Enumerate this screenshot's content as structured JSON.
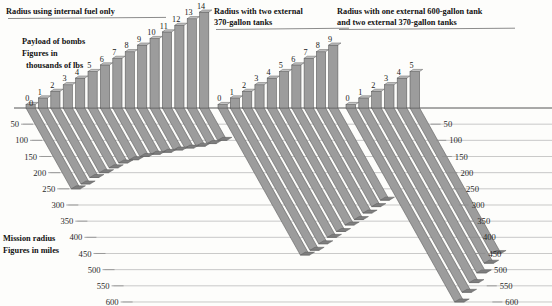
{
  "figure": {
    "kind": "combat-radius-infographic",
    "legend_note_line1": "Payload of bombs",
    "legend_note_line2": "Figures in",
    "legend_note_line3": "thousands of lbs",
    "axis_note_line1": "Mission radius",
    "axis_note_line2": "Figures in miles",
    "panel_titles": [
      {
        "line1": "Radius using internal fuel only",
        "line2": ""
      },
      {
        "line1": "Radius with two external",
        "line2": "370-gallon tanks"
      },
      {
        "line1": "Radius with one external 600-gallon tank",
        "line2": "and two external 370-gallon tanks"
      }
    ],
    "colors": {
      "bar_fill": "#9c9c9c",
      "bar_edge": "#5e5e5e",
      "bar_top": "#c3c3c3",
      "gridline": "#b7b7b7",
      "baseline": "#555555",
      "text": "#1a1a1a",
      "background": "#fdfdfb"
    }
  },
  "axis": {
    "label": "Mission radius",
    "unit": "miles",
    "ticks": [
      0,
      50,
      100,
      150,
      200,
      250,
      300,
      350,
      400,
      450,
      500,
      550,
      600
    ],
    "tick_labels": [
      "0",
      "50",
      "100",
      "150",
      "200",
      "250",
      "300",
      "350",
      "400",
      "450",
      "500",
      "550",
      "600"
    ],
    "min": 0,
    "max": 600
  },
  "chart_data": [
    {
      "type": "bar",
      "title": "Radius using internal fuel only",
      "xlabel": "Payload of bombs (thousands of lbs)",
      "ylabel": "Mission radius (miles)",
      "categories": [
        "0",
        "1",
        "2",
        "3",
        "4",
        "5",
        "6",
        "7",
        "8",
        "9",
        "10",
        "11",
        "12",
        "13",
        "14"
      ],
      "payload_klbs": [
        0,
        1,
        2,
        3,
        4,
        5,
        6,
        7,
        8,
        9,
        10,
        11,
        12,
        13,
        14
      ],
      "radius_miles": [
        250,
        235,
        215,
        200,
        185,
        170,
        160,
        150,
        143,
        137,
        130,
        124,
        118,
        110,
        100
      ],
      "ylim": [
        0,
        600
      ]
    },
    {
      "type": "bar",
      "title": "Radius with two external 370-gallon tanks",
      "xlabel": "Payload of bombs (thousands of lbs)",
      "ylabel": "Mission radius (miles)",
      "categories": [
        "0",
        "1",
        "2",
        "3",
        "4",
        "5",
        "6",
        "7",
        "8",
        "9"
      ],
      "payload_klbs": [
        0,
        1,
        2,
        3,
        4,
        5,
        6,
        7,
        8,
        9
      ],
      "radius_miles": [
        455,
        440,
        420,
        400,
        382,
        362,
        345,
        325,
        305,
        285
      ],
      "ylim": [
        0,
        600
      ]
    },
    {
      "type": "bar",
      "title": "Radius with one external 600-gallon tank and two external 370-gallon tanks",
      "xlabel": "Payload of bombs (thousands of lbs)",
      "ylabel": "Mission radius (miles)",
      "categories": [
        "0",
        "1",
        "2",
        "3",
        "4",
        "5"
      ],
      "payload_klbs": [
        0,
        1,
        2,
        3,
        4,
        5
      ],
      "radius_miles": [
        600,
        570,
        540,
        510,
        480,
        450
      ],
      "ylim": [
        0,
        600
      ]
    }
  ]
}
